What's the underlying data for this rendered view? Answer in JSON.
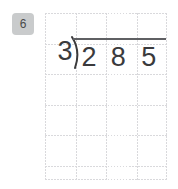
{
  "canvas": {
    "width": 178,
    "height": 189,
    "background": "#ffffff"
  },
  "problem_number": {
    "label": "6",
    "badge_color": "#c9cbcc",
    "text_color": "#4a4a4a"
  },
  "grid": {
    "columns": 4,
    "rows": 5,
    "cell_width": 30.5,
    "cell_height": 30.5,
    "line_color": "#d9d9dc",
    "style": "dotted"
  },
  "division": {
    "divisor": "3",
    "dividend_digits": [
      "2",
      "8",
      "5"
    ],
    "dividend": "285",
    "bracket_glyph": ")",
    "quotient_digits": [],
    "bar_color": "#5f6063",
    "digit_color": "#3a3a3c",
    "expression": "285 ÷ 3"
  }
}
